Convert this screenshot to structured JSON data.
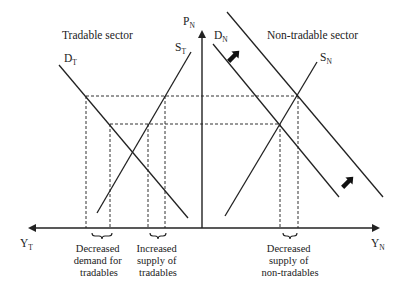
{
  "diagram": {
    "title_left": "Tradable sector",
    "title_right": "Non-tradable sector",
    "axes": {
      "vertical": {
        "label": "P",
        "subscript": "N"
      },
      "left": {
        "label": "Y",
        "subscript": "T"
      },
      "right": {
        "label": "Y",
        "subscript": "N"
      }
    },
    "curves": {
      "demand_tradable": {
        "label": "D",
        "subscript": "T"
      },
      "supply_tradable": {
        "label": "S",
        "subscript": "T"
      },
      "demand_nontradable": {
        "label": "D",
        "subscript": "N"
      },
      "supply_nontradable": {
        "label": "S",
        "subscript": "N"
      }
    },
    "annotations": {
      "decreased_demand_tradables": [
        "Decreased",
        "demand for",
        "tradables"
      ],
      "increased_supply_tradables": [
        "Increased",
        "supply of",
        "tradables"
      ],
      "decreased_supply_nontradables": [
        "Decreased",
        "supply of",
        "non-tradables"
      ]
    },
    "shift_arrows": [
      "down-left",
      "down-left"
    ],
    "colors": {
      "line": "#222222",
      "background": "#ffffff"
    }
  }
}
